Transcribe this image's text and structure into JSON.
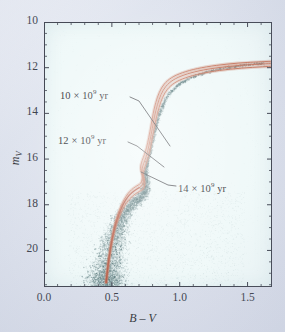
{
  "figure": {
    "kind": "color-magnitude-diagram",
    "background_color": "#d9dee9",
    "plot_background_color": "#eef8f8"
  },
  "axes": {
    "x": {
      "label": "B – V",
      "label_plain": "B - V",
      "ticks": [
        "0.0",
        "0.5",
        "1.0",
        "1.5"
      ],
      "tick_values": [
        0.0,
        0.5,
        1.0,
        1.5
      ],
      "range": [
        0.0,
        1.68
      ],
      "minor_tick_step": 0.1
    },
    "y": {
      "label": "mV",
      "label_main": "m",
      "label_sub": "V",
      "ticks": [
        "10",
        "12",
        "14",
        "16",
        "18",
        "20"
      ],
      "tick_values": [
        10,
        12,
        14,
        16,
        18,
        20
      ],
      "range": [
        10,
        21.6
      ],
      "inverted": true,
      "minor_tick_step": 0.5
    }
  },
  "annotations": [
    {
      "id": "iso-10",
      "text_main": "10 × 10",
      "exponent": "9",
      "text_tail": " yr",
      "full_text": "10 × 10^9 yr",
      "age_gyr": 10,
      "label_x": 60,
      "label_y": 88,
      "leader": [
        [
          130,
          97
        ],
        [
          139,
          101
        ],
        [
          170,
          146
        ]
      ]
    },
    {
      "id": "iso-12",
      "text_main": "12 × 10",
      "exponent": "9",
      "text_tail": " yr",
      "full_text": "12 × 10^9 yr",
      "age_gyr": 12,
      "label_x": 58,
      "label_y": 133,
      "leader": [
        [
          128,
          142
        ],
        [
          137,
          146
        ],
        [
          164,
          167
        ]
      ]
    },
    {
      "id": "iso-14",
      "text_main": "14 × 10",
      "exponent": "9",
      "text_tail": " yr",
      "full_text": "14 × 10^9 yr",
      "age_gyr": 14,
      "label_x": 178,
      "label_y": 181,
      "leader": [
        [
          176,
          186
        ],
        [
          168,
          185
        ],
        [
          141,
          172
        ]
      ]
    }
  ],
  "chart_data": {
    "type": "scatter",
    "title": "",
    "xlabel": "B – V",
    "ylabel": "mV",
    "xlim": [
      0.0,
      1.68
    ],
    "ylim": [
      21.6,
      10.0
    ],
    "grid": false,
    "legend": "none",
    "xticks": [
      0.0,
      0.5,
      1.0,
      1.5
    ],
    "yticks": [
      10,
      12,
      14,
      16,
      18,
      20
    ],
    "scatter": {
      "name": "cluster stars",
      "color": "#4d6e70",
      "point_count_approx": 9000,
      "description": "Dense stellar locus tracing the main sequence, turnoff, subgiant and red-giant branches of a globular cluster, with a broad scattered halo of faint points below the main sequence."
    },
    "series": [
      {
        "name": "10 × 10^9 yr isochrone",
        "age_gyr": 10,
        "color": "#c1694f",
        "points": [
          [
            0.455,
            21.4
          ],
          [
            0.47,
            20.6
          ],
          [
            0.487,
            19.9
          ],
          [
            0.505,
            19.3
          ],
          [
            0.524,
            18.8
          ],
          [
            0.545,
            18.4
          ],
          [
            0.568,
            18.05
          ],
          [
            0.592,
            17.76
          ],
          [
            0.618,
            17.52
          ],
          [
            0.646,
            17.34
          ],
          [
            0.672,
            17.22
          ],
          [
            0.694,
            17.14
          ],
          [
            0.712,
            17.06
          ],
          [
            0.722,
            16.92
          ],
          [
            0.724,
            16.74
          ],
          [
            0.718,
            16.58
          ],
          [
            0.712,
            16.42
          ],
          [
            0.714,
            16.26
          ],
          [
            0.724,
            16.06
          ],
          [
            0.74,
            15.8
          ],
          [
            0.756,
            15.48
          ],
          [
            0.772,
            15.05
          ],
          [
            0.788,
            14.55
          ],
          [
            0.804,
            14.02
          ],
          [
            0.824,
            13.52
          ],
          [
            0.85,
            13.08
          ],
          [
            0.886,
            12.72
          ],
          [
            0.94,
            12.44
          ],
          [
            1.02,
            12.22
          ],
          [
            1.13,
            12.04
          ],
          [
            1.27,
            11.9
          ],
          [
            1.43,
            11.8
          ],
          [
            1.6,
            11.74
          ],
          [
            1.68,
            11.72
          ]
        ]
      },
      {
        "name": "12 × 10^9 yr isochrone",
        "age_gyr": 12,
        "color": "#c1694f",
        "points": [
          [
            0.458,
            21.4
          ],
          [
            0.473,
            20.6
          ],
          [
            0.49,
            19.9
          ],
          [
            0.509,
            19.3
          ],
          [
            0.529,
            18.82
          ],
          [
            0.551,
            18.44
          ],
          [
            0.574,
            18.1
          ],
          [
            0.599,
            17.82
          ],
          [
            0.626,
            17.6
          ],
          [
            0.654,
            17.44
          ],
          [
            0.68,
            17.33
          ],
          [
            0.702,
            17.25
          ],
          [
            0.719,
            17.18
          ],
          [
            0.73,
            17.05
          ],
          [
            0.733,
            16.88
          ],
          [
            0.728,
            16.72
          ],
          [
            0.722,
            16.56
          ],
          [
            0.724,
            16.4
          ],
          [
            0.734,
            16.2
          ],
          [
            0.75,
            15.94
          ],
          [
            0.766,
            15.6
          ],
          [
            0.782,
            15.16
          ],
          [
            0.798,
            14.66
          ],
          [
            0.815,
            14.12
          ],
          [
            0.836,
            13.62
          ],
          [
            0.862,
            13.18
          ],
          [
            0.898,
            12.82
          ],
          [
            0.952,
            12.54
          ],
          [
            1.032,
            12.32
          ],
          [
            1.142,
            12.14
          ],
          [
            1.282,
            12.0
          ],
          [
            1.442,
            11.9
          ],
          [
            1.605,
            11.84
          ],
          [
            1.68,
            11.82
          ]
        ]
      },
      {
        "name": "14 × 10^9 yr isochrone",
        "age_gyr": 14,
        "color": "#c1694f",
        "points": [
          [
            0.461,
            21.4
          ],
          [
            0.477,
            20.6
          ],
          [
            0.494,
            19.9
          ],
          [
            0.513,
            19.32
          ],
          [
            0.534,
            18.86
          ],
          [
            0.557,
            18.5
          ],
          [
            0.581,
            18.18
          ],
          [
            0.607,
            17.92
          ],
          [
            0.635,
            17.72
          ],
          [
            0.663,
            17.57
          ],
          [
            0.69,
            17.46
          ],
          [
            0.712,
            17.38
          ],
          [
            0.729,
            17.31
          ],
          [
            0.74,
            17.18
          ],
          [
            0.743,
            17.02
          ],
          [
            0.738,
            16.86
          ],
          [
            0.732,
            16.7
          ],
          [
            0.734,
            16.54
          ],
          [
            0.744,
            16.34
          ],
          [
            0.76,
            16.08
          ],
          [
            0.776,
            15.74
          ],
          [
            0.792,
            15.28
          ],
          [
            0.808,
            14.78
          ],
          [
            0.826,
            14.24
          ],
          [
            0.848,
            13.74
          ],
          [
            0.874,
            13.3
          ],
          [
            0.91,
            12.94
          ],
          [
            0.964,
            12.66
          ],
          [
            1.044,
            12.44
          ],
          [
            1.154,
            12.26
          ],
          [
            1.294,
            12.12
          ],
          [
            1.454,
            12.02
          ],
          [
            1.61,
            11.96
          ],
          [
            1.68,
            11.94
          ]
        ]
      }
    ]
  }
}
